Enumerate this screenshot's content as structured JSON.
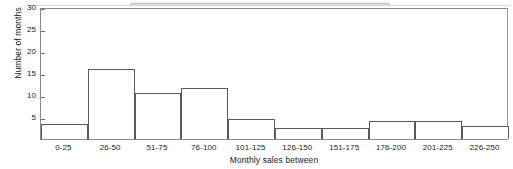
{
  "chart_data": {
    "type": "bar",
    "title": "",
    "subtitle": "",
    "xlabel": "Monthly sales between",
    "ylabel": "Number of months",
    "categories": [
      "0-25",
      "26-50",
      "51-75",
      "76-100",
      "101-125",
      "126-150",
      "151-175",
      "176-200",
      "201-225",
      "226-250"
    ],
    "values": [
      3.5,
      16,
      10.5,
      11.5,
      4.5,
      2.5,
      2.5,
      4,
      4,
      3
    ],
    "ylim": [
      0,
      30
    ],
    "xlim": [
      0,
      250
    ],
    "ytick_labels": [
      "5",
      "10",
      "15",
      "20",
      "25",
      "30"
    ],
    "ytick_values": [
      5,
      10,
      15,
      20,
      25,
      30
    ],
    "grid": false,
    "legend": null,
    "legend_position": "none",
    "series": [
      {
        "name": "Number of months",
        "values": [
          3.5,
          16,
          10.5,
          11.5,
          4.5,
          2.5,
          2.5,
          4,
          4,
          3
        ]
      }
    ],
    "bar_style": {
      "fill": "#ffffff",
      "edge": "#5a5a5a"
    },
    "annotations": []
  },
  "figure": {
    "background": "#ffffff",
    "axis_color": "#8a8a8a",
    "text_color": "#1a1a1a",
    "artifact": "scan-streak"
  }
}
